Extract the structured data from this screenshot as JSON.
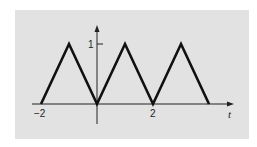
{
  "chart_data": {
    "type": "line",
    "title": "",
    "xlabel": "t",
    "ylabel": "",
    "x": [
      -2,
      -1,
      0,
      1,
      2,
      3,
      4
    ],
    "series": [
      {
        "name": "triangle wave",
        "values": [
          0,
          1,
          0,
          1,
          0,
          1,
          0
        ]
      }
    ],
    "x_ticks": [
      {
        "value": -2,
        "label": "−2"
      },
      {
        "value": 2,
        "label": "2"
      }
    ],
    "y_ticks": [
      {
        "value": 1,
        "label": "1"
      }
    ],
    "xlim": [
      -2.3,
      4.9
    ],
    "ylim": [
      -0.3,
      1.3
    ],
    "grid": false,
    "legend": null,
    "colors": {
      "background": "#e2e2e2",
      "line": "#111111",
      "axis": "#222222"
    }
  },
  "labels": {
    "x_axis": "t",
    "x_tick_neg2": "−2",
    "x_tick_2": "2",
    "y_tick_1": "1"
  }
}
